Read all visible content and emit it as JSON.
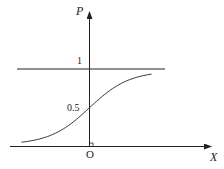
{
  "chart_data": {
    "type": "line",
    "title": "",
    "xlabel": "X",
    "ylabel": "P",
    "origin_label": "O",
    "xlim": [
      -3.5,
      3.5
    ],
    "ylim": [
      0,
      1.3
    ],
    "yticks": [
      {
        "value": 1,
        "label": "1"
      },
      {
        "value": 0.5,
        "label": "0.5"
      }
    ],
    "reference_lines": [
      {
        "orientation": "horizontal",
        "value": 1,
        "x_range": [
          -3.5,
          3.5
        ]
      }
    ],
    "series": [
      {
        "name": "P(X) logistic curve",
        "function": "sigmoid",
        "x_range": [
          -3.4,
          3.1
        ],
        "points": [
          {
            "x": -3.4,
            "y": 0.05
          },
          {
            "x": -2.0,
            "y": 0.12
          },
          {
            "x": -1.0,
            "y": 0.27
          },
          {
            "x": 0.0,
            "y": 0.5
          },
          {
            "x": 1.0,
            "y": 0.73
          },
          {
            "x": 2.0,
            "y": 0.88
          },
          {
            "x": 3.1,
            "y": 0.95
          }
        ]
      }
    ],
    "grid": false,
    "legend": "none",
    "colors": {
      "axis": "#222222",
      "curve": "#333333"
    }
  }
}
